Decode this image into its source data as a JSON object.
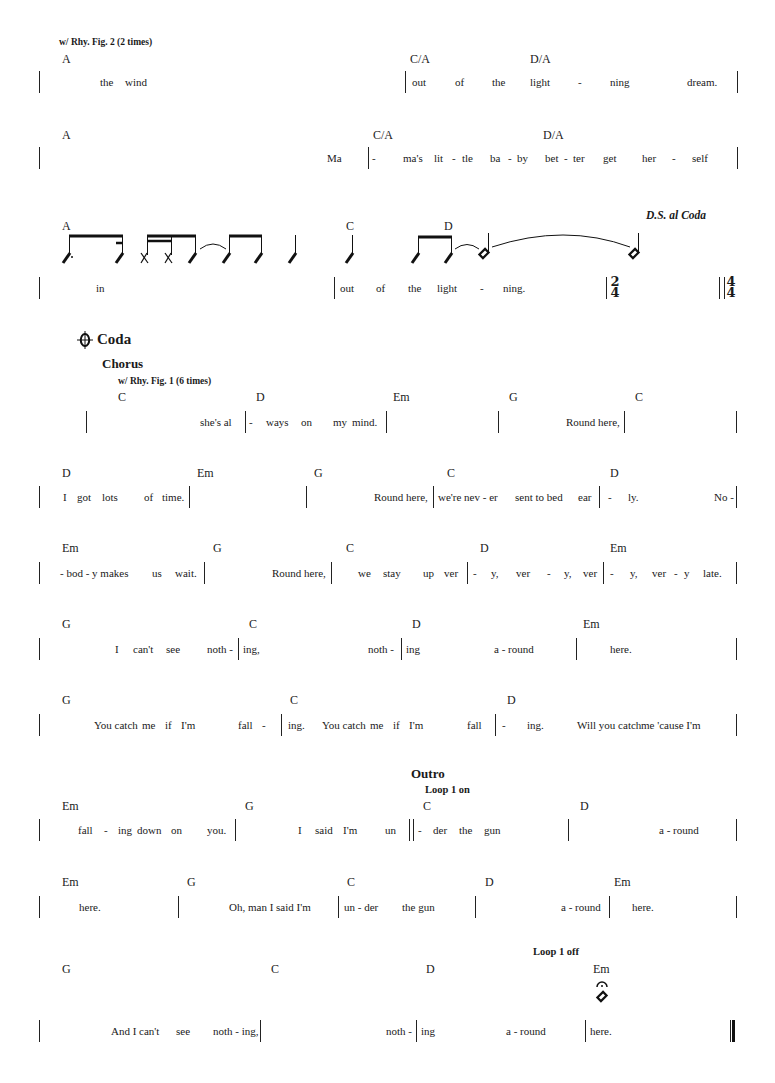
{
  "colors": {
    "ink": "#1a1a1a",
    "background": "#ffffff"
  },
  "system1": {
    "direction": "w/ Rhy. Fig. 2 (2 times)",
    "chords": [
      "A",
      "C/A",
      "D/A"
    ],
    "lyrics": [
      "the",
      "wind",
      "out",
      "of",
      "the",
      "light",
      "-",
      "ning",
      "dream."
    ]
  },
  "system2": {
    "chords": [
      "A",
      "C/A",
      "D/A"
    ],
    "lyrics": [
      "Ma",
      "-",
      "ma's",
      "lit",
      "-",
      "tle",
      "ba",
      "-",
      "by",
      "bet",
      "-",
      "ter",
      "get",
      "her",
      "-",
      "self"
    ]
  },
  "system3": {
    "chords": [
      "A",
      "C",
      "D"
    ],
    "instruction": "D.S. al Coda",
    "lyrics": [
      "in",
      "out",
      "of",
      "the",
      "light",
      "-",
      "ning."
    ],
    "time_signatures": [
      {
        "top": "2",
        "bottom": "4"
      },
      {
        "top": "4",
        "bottom": "4"
      }
    ]
  },
  "coda": {
    "symbol": "coda-sign",
    "label": "Coda",
    "section": "Chorus",
    "direction": "w/ Rhy. Fig. 1 (6 times)"
  },
  "system4": {
    "chords": [
      "C",
      "D",
      "Em",
      "G",
      "C"
    ],
    "lyrics": [
      "she's al",
      "-",
      "ways",
      "on",
      "my",
      "mind.",
      "Round here,"
    ]
  },
  "system5": {
    "chords": [
      "D",
      "Em",
      "G",
      "C",
      "D"
    ],
    "lyrics": [
      "I",
      "got",
      "lots",
      "of",
      "time.",
      "Round here,",
      "we're nev - er",
      "sent to bed",
      "ear",
      "-",
      "ly.",
      "No -"
    ]
  },
  "system6": {
    "chords": [
      "Em",
      "G",
      "C",
      "D",
      "Em"
    ],
    "lyrics": [
      "- bod - y makes",
      "us",
      "wait.",
      "Round here,",
      "we",
      "stay",
      "up",
      "ver",
      "-",
      "y,",
      "ver",
      "-",
      "y,",
      "ver",
      "-",
      "y,",
      "ver",
      "-",
      "y",
      "late."
    ]
  },
  "system7": {
    "chords": [
      "G",
      "C",
      "D",
      "Em"
    ],
    "lyrics": [
      "I",
      "can't",
      "see",
      "noth -",
      "ing,",
      "noth -",
      "ing",
      "a - round",
      "here."
    ]
  },
  "system8": {
    "chords": [
      "G",
      "C",
      "D"
    ],
    "lyrics": [
      "You catch",
      "me",
      "if",
      "I'm",
      "fall",
      "-",
      "ing.",
      "You catch",
      "me",
      "if",
      "I'm",
      "fall",
      "-",
      "ing.",
      "Will you catch",
      "me 'cause I'm"
    ]
  },
  "outro": {
    "section": "Outro",
    "loop_on": "Loop 1 on",
    "loop_off": "Loop 1 off"
  },
  "system9": {
    "chords": [
      "Em",
      "G",
      "C",
      "D"
    ],
    "lyrics": [
      "fall",
      "-",
      "ing",
      "down",
      "on",
      "you.",
      "I",
      "said",
      "I'm",
      "un",
      "-",
      "der",
      "the",
      "gun",
      "a - round"
    ]
  },
  "system10": {
    "chords": [
      "Em",
      "G",
      "C",
      "D",
      "Em"
    ],
    "lyrics": [
      "here.",
      "Oh, man I said I'm",
      "un - der",
      "the gun",
      "a - round",
      "here."
    ]
  },
  "system11": {
    "chords": [
      "G",
      "C",
      "D",
      "Em"
    ],
    "fermata": "fermata-icon",
    "lyrics": [
      "And I can't",
      "see",
      "noth - ing,",
      "noth -",
      "ing",
      "a - round",
      "here."
    ]
  }
}
